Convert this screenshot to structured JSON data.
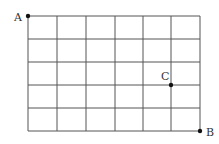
{
  "diagram": {
    "type": "grid-path",
    "columns": 6,
    "rows": 5,
    "origin": {
      "x": 28,
      "y": 16
    },
    "x_lines": [
      28,
      57,
      86,
      115,
      143,
      171,
      200
    ],
    "y_lines": [
      16,
      39,
      62,
      85,
      108,
      131
    ],
    "line_color": "#555555",
    "points": [
      {
        "label": "A",
        "x": 28,
        "y": 16,
        "label_x": 14,
        "label_y": 21
      },
      {
        "label": "C",
        "x": 171,
        "y": 85,
        "label_x": 161,
        "label_y": 80
      },
      {
        "label": "B",
        "x": 200,
        "y": 131,
        "label_x": 206,
        "label_y": 136
      }
    ]
  }
}
